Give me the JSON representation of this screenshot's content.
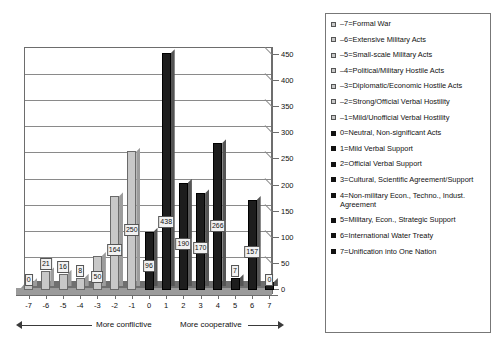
{
  "chart_data": {
    "type": "bar",
    "title": "",
    "subtitle": "",
    "xlabel": "",
    "ylabel": "",
    "categories": [
      "-7",
      "-6",
      "-5",
      "-4",
      "-3",
      "-2",
      "-1",
      "0",
      "1",
      "2",
      "3",
      "4",
      "5",
      "6",
      "7"
    ],
    "values": [
      0,
      21,
      16,
      8,
      50,
      164,
      250,
      96,
      438,
      190,
      170,
      266,
      7,
      157,
      0
    ],
    "bar_colors": [
      "#c8c8c8",
      "#c8c8c8",
      "#c8c8c8",
      "#c8c8c8",
      "#c8c8c8",
      "#c8c8c8",
      "#c8c8c8",
      "#1d1d1d",
      "#1d1d1d",
      "#1d1d1d",
      "#1d1d1d",
      "#1d1d1d",
      "#1d1d1d",
      "#1d1d1d",
      "#1d1d1d"
    ],
    "ylim": [
      0,
      450
    ],
    "yticks": [
      0,
      50,
      100,
      150,
      200,
      250,
      300,
      350,
      400,
      450
    ],
    "grid": true,
    "data_labels": true,
    "legend_position": "right",
    "annotations": {
      "left_direction": "More conflictive",
      "right_direction": "More cooperative"
    },
    "legend": [
      {
        "key": "-7",
        "label": "–7=Formal War",
        "color": "#c8c8c8"
      },
      {
        "key": "-6",
        "label": "–6=Extensive Military Acts",
        "color": "#c8c8c8"
      },
      {
        "key": "-5",
        "label": "–5=Small-scale Military Acts",
        "color": "#c8c8c8"
      },
      {
        "key": "-4",
        "label": "–4=Political/Military Hostile Acts",
        "color": "#c8c8c8"
      },
      {
        "key": "-3",
        "label": "–3=Diplomatic/Economic Hostile Acts",
        "color": "#c8c8c8"
      },
      {
        "key": "-2",
        "label": "–2=Strong/Official Verbal Hostility",
        "color": "#c8c8c8"
      },
      {
        "key": "-1",
        "label": "–1=Mild/Unofficial Verbal Hostility",
        "color": "#c8c8c8"
      },
      {
        "key": "0",
        "label": "0=Neutral, Non-significant Acts",
        "color": "#1d1d1d"
      },
      {
        "key": "1",
        "label": "1=Mild Verbal Support",
        "color": "#1d1d1d"
      },
      {
        "key": "2",
        "label": "2=Official Verbal Support",
        "color": "#1d1d1d"
      },
      {
        "key": "3",
        "label": "3=Cultural, Scientific Agreement/Support",
        "color": "#1d1d1d"
      },
      {
        "key": "4",
        "label": "4=Non-military Econ., Techno., Indust. Agreement",
        "color": "#1d1d1d"
      },
      {
        "key": "5",
        "label": "5=Military, Econ., Strategic Support",
        "color": "#1d1d1d"
      },
      {
        "key": "6",
        "label": "6=International Water Treaty",
        "color": "#1d1d1d"
      },
      {
        "key": "7",
        "label": "7=Unification into One Nation",
        "color": "#1d1d1d"
      }
    ]
  }
}
